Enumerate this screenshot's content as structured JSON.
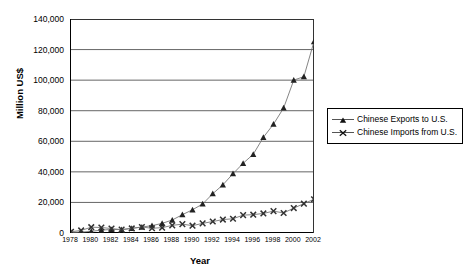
{
  "chart_data": {
    "type": "line",
    "title": "",
    "xlabel": "Year",
    "ylabel": "Million US$",
    "xlim": [
      1978,
      2002
    ],
    "ylim": [
      0,
      140000
    ],
    "ytick_step": 20000,
    "grid": "horizontal",
    "legend_position": "right",
    "x": [
      1978,
      1979,
      1980,
      1981,
      1982,
      1983,
      1984,
      1985,
      1986,
      1987,
      1988,
      1989,
      1990,
      1991,
      1992,
      1993,
      1994,
      1995,
      1996,
      1997,
      1998,
      1999,
      2000,
      2001,
      2002
    ],
    "xtick_labels": [
      "1978",
      "1980",
      "1982",
      "1984",
      "1986",
      "1988",
      "1990",
      "1992",
      "1994",
      "1996",
      "1998",
      "2000",
      "2002"
    ],
    "ytick_labels": [
      "0",
      "20,000",
      "40,000",
      "60,000",
      "80,000",
      "100,000",
      "120,000",
      "140,000"
    ],
    "series": [
      {
        "name": "Chinese Exports to U.S.",
        "marker": "triangle",
        "color": "#222222",
        "values": [
          400,
          600,
          1100,
          1900,
          2300,
          2200,
          3100,
          3900,
          4800,
          6300,
          8500,
          12000,
          15200,
          19000,
          25700,
          31500,
          38800,
          45600,
          51500,
          62600,
          71200,
          81800,
          100000,
          102300,
          125200
        ]
      },
      {
        "name": "Chinese Imports from U.S.",
        "marker": "x",
        "color": "#333333",
        "values": [
          800,
          1700,
          3800,
          3600,
          2900,
          2200,
          3000,
          3900,
          3100,
          3500,
          5000,
          5800,
          4800,
          6300,
          7500,
          8800,
          9300,
          11700,
          12000,
          12800,
          14300,
          13100,
          16300,
          19200,
          22100
        ]
      }
    ]
  },
  "legend": {
    "items": [
      {
        "label": "Chinese Exports to U.S."
      },
      {
        "label": "Chinese Imports from U.S."
      }
    ]
  },
  "axes": {
    "y_title": "Million US$",
    "x_title": "Year"
  }
}
